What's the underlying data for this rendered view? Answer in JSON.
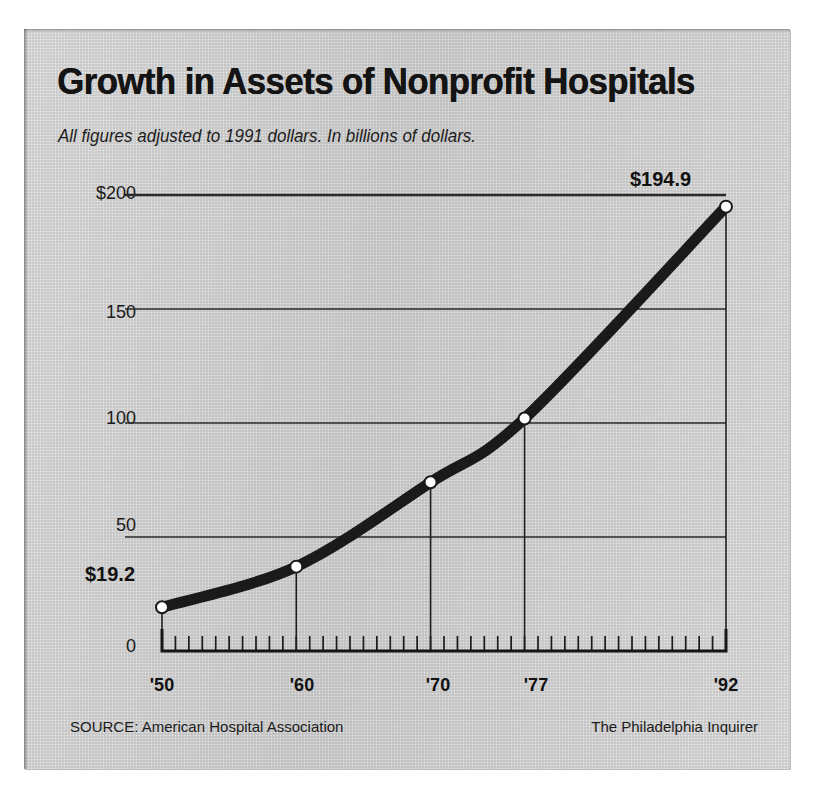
{
  "header": {
    "title": "Growth in Assets of Nonprofit Hospitals",
    "subtitle": "All figures adjusted to 1991 dollars. In billions of dollars."
  },
  "footer": {
    "source": "SOURCE: American Hospital Association",
    "credit": "The Philadelphia Inquirer"
  },
  "axis": {
    "y_ticks": [
      "$200",
      "150",
      "100",
      "50",
      "0"
    ],
    "x_ticks": [
      "'50",
      "'60",
      "'70",
      "'77",
      "'92"
    ]
  },
  "annotations": {
    "start_value": "$19.2",
    "end_value": "$194.9"
  },
  "colors": {
    "panel": "#cfcfcf",
    "ink": "#111111",
    "line": "#1a1a1a",
    "marker_fill": "#ffffff",
    "gridline": "#2a2a2a"
  },
  "chart_data": {
    "type": "line",
    "title": "Growth in Assets of Nonprofit Hospitals",
    "subtitle": "All figures adjusted to 1991 dollars. In billions of dollars.",
    "xlabel": "",
    "ylabel": "Billions of dollars",
    "x": [
      1950,
      1960,
      1970,
      1977,
      1992
    ],
    "x_tick_labels": [
      "'50",
      "'60",
      "'70",
      "'77",
      "'92"
    ],
    "values": [
      19.2,
      37.0,
      74.0,
      102.0,
      194.9
    ],
    "point_labels": [
      "$19.2",
      "",
      "",
      "",
      "$194.9"
    ],
    "ylim": [
      0,
      200
    ],
    "y_ticks": [
      0,
      50,
      100,
      150,
      200
    ],
    "y_tick_labels": [
      "0",
      "50",
      "100",
      "150",
      "$200"
    ],
    "xlim": [
      1950,
      1992
    ],
    "minor_x_tick_interval": 1,
    "grid": "horizontal",
    "legend": "none",
    "marker": "open-circle",
    "drop_lines": true,
    "source": "SOURCE: American Hospital Association",
    "credit": "The Philadelphia Inquirer"
  }
}
